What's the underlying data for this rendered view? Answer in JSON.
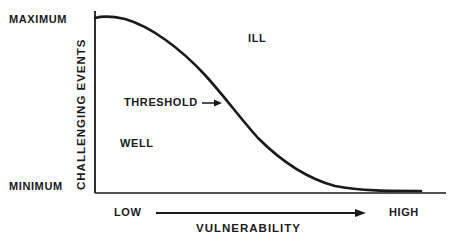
{
  "diagram": {
    "y_axis": {
      "title": "CHALLENGING EVENTS",
      "max_label": "MAXIMUM",
      "min_label": "MINIMUM"
    },
    "x_axis": {
      "title": "VULNERABILITY",
      "low_label": "LOW",
      "high_label": "HIGH"
    },
    "regions": {
      "above_curve": "ILL",
      "below_curve": "WELL"
    },
    "curve_label": "THRESHOLD",
    "colors": {
      "ink": "#1a1a1a",
      "background": "#ffffff"
    }
  }
}
